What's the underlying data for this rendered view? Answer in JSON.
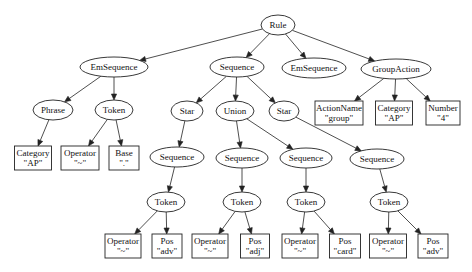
{
  "diagram": {
    "type": "parse-tree",
    "nodes": [
      {
        "id": "rule",
        "label": "Rule",
        "shape": "ellipse",
        "x": 278,
        "y": 25,
        "rx": 17,
        "ry": 10
      },
      {
        "id": "emseq1",
        "label": "EmSequence",
        "shape": "ellipse",
        "x": 114,
        "y": 67,
        "rx": 34,
        "ry": 10
      },
      {
        "id": "seq",
        "label": "Sequence",
        "shape": "ellipse",
        "x": 237,
        "y": 67,
        "rx": 27,
        "ry": 10
      },
      {
        "id": "emseq2",
        "label": "EmSequence",
        "shape": "ellipse",
        "x": 314,
        "y": 68,
        "rx": 32,
        "ry": 10
      },
      {
        "id": "groupaction",
        "label": "GroupAction",
        "shape": "ellipse",
        "x": 396,
        "y": 69,
        "rx": 35,
        "ry": 10
      },
      {
        "id": "phrase",
        "label": "Phrase",
        "shape": "ellipse",
        "x": 53,
        "y": 110,
        "rx": 20,
        "ry": 10
      },
      {
        "id": "token0",
        "label": "Token",
        "shape": "ellipse",
        "x": 114,
        "y": 110,
        "rx": 19,
        "ry": 10
      },
      {
        "id": "star1",
        "label": "Star",
        "shape": "ellipse",
        "x": 187,
        "y": 111,
        "rx": 16,
        "ry": 10
      },
      {
        "id": "union",
        "label": "Union",
        "shape": "ellipse",
        "x": 235,
        "y": 111,
        "rx": 19,
        "ry": 10
      },
      {
        "id": "star2",
        "label": "Star",
        "shape": "ellipse",
        "x": 284,
        "y": 111,
        "rx": 15,
        "ry": 10
      },
      {
        "id": "actionname",
        "label": "ActionName",
        "value": "\"group\"",
        "shape": "box",
        "x": 339,
        "y": 113,
        "w": 48,
        "h": 24
      },
      {
        "id": "category2",
        "label": "Category",
        "value": "\"AP\"",
        "shape": "box",
        "x": 394,
        "y": 113,
        "w": 37,
        "h": 24
      },
      {
        "id": "number",
        "label": "Number",
        "value": "\"4\"",
        "shape": "box",
        "x": 443,
        "y": 113,
        "w": 34,
        "h": 24
      },
      {
        "id": "category1",
        "label": "Category",
        "value": "\"AP\"",
        "shape": "box",
        "x": 33,
        "y": 158,
        "w": 37,
        "h": 24
      },
      {
        "id": "operator0",
        "label": "Operator",
        "value": "\"~\"",
        "shape": "box",
        "x": 80,
        "y": 158,
        "w": 38,
        "h": 24
      },
      {
        "id": "base",
        "label": "Base",
        "value": "\".\"",
        "shape": "box",
        "x": 124,
        "y": 158,
        "w": 30,
        "h": 24
      },
      {
        "id": "seq1",
        "label": "Sequence",
        "shape": "ellipse",
        "x": 177,
        "y": 157,
        "rx": 27,
        "ry": 10
      },
      {
        "id": "seq2",
        "label": "Sequence",
        "shape": "ellipse",
        "x": 242,
        "y": 158,
        "rx": 26,
        "ry": 10
      },
      {
        "id": "seq3",
        "label": "Sequence",
        "shape": "ellipse",
        "x": 306,
        "y": 158,
        "rx": 26,
        "ry": 10
      },
      {
        "id": "seq4",
        "label": "Sequence",
        "shape": "ellipse",
        "x": 377,
        "y": 159,
        "rx": 27,
        "ry": 10
      },
      {
        "id": "token1",
        "label": "Token",
        "shape": "ellipse",
        "x": 166,
        "y": 202,
        "rx": 19,
        "ry": 10
      },
      {
        "id": "token2",
        "label": "Token",
        "shape": "ellipse",
        "x": 242,
        "y": 202,
        "rx": 19,
        "ry": 10
      },
      {
        "id": "token3",
        "label": "Token",
        "shape": "ellipse",
        "x": 306,
        "y": 202,
        "rx": 19,
        "ry": 10
      },
      {
        "id": "token4",
        "label": "Token",
        "shape": "ellipse",
        "x": 389,
        "y": 202,
        "rx": 19,
        "ry": 10
      },
      {
        "id": "op1",
        "label": "Operator",
        "value": "\"~\"",
        "shape": "box",
        "x": 123,
        "y": 246,
        "w": 36,
        "h": 24
      },
      {
        "id": "pos1",
        "label": "Pos",
        "value": "\"adv\"",
        "shape": "box",
        "x": 167,
        "y": 246,
        "w": 30,
        "h": 24
      },
      {
        "id": "op2",
        "label": "Operator",
        "value": "\"~\"",
        "shape": "box",
        "x": 210,
        "y": 246,
        "w": 36,
        "h": 24
      },
      {
        "id": "pos2",
        "label": "Pos",
        "value": "\"adj\"",
        "shape": "box",
        "x": 255,
        "y": 246,
        "w": 29,
        "h": 24
      },
      {
        "id": "op3",
        "label": "Operator",
        "value": "\"~\"",
        "shape": "box",
        "x": 300,
        "y": 246,
        "w": 36,
        "h": 24
      },
      {
        "id": "pos3",
        "label": "Pos",
        "value": "\"card\"",
        "shape": "box",
        "x": 345,
        "y": 246,
        "w": 31,
        "h": 24
      },
      {
        "id": "op4",
        "label": "Operator",
        "value": "\"~\"",
        "shape": "box",
        "x": 388,
        "y": 246,
        "w": 37,
        "h": 24
      },
      {
        "id": "pos4",
        "label": "Pos",
        "value": "\"adv\"",
        "shape": "box",
        "x": 433,
        "y": 246,
        "w": 30,
        "h": 24
      }
    ],
    "edges": [
      [
        "rule",
        "emseq1"
      ],
      [
        "rule",
        "seq"
      ],
      [
        "rule",
        "emseq2"
      ],
      [
        "rule",
        "groupaction"
      ],
      [
        "emseq1",
        "phrase"
      ],
      [
        "emseq1",
        "token0"
      ],
      [
        "seq",
        "star1"
      ],
      [
        "seq",
        "union"
      ],
      [
        "seq",
        "star2"
      ],
      [
        "groupaction",
        "actionname"
      ],
      [
        "groupaction",
        "category2"
      ],
      [
        "groupaction",
        "number"
      ],
      [
        "phrase",
        "category1"
      ],
      [
        "token0",
        "operator0"
      ],
      [
        "token0",
        "base"
      ],
      [
        "star1",
        "seq1"
      ],
      [
        "union",
        "seq2"
      ],
      [
        "union",
        "seq3"
      ],
      [
        "star2",
        "seq4"
      ],
      [
        "seq1",
        "token1"
      ],
      [
        "seq2",
        "token2"
      ],
      [
        "seq3",
        "token3"
      ],
      [
        "seq4",
        "token4"
      ],
      [
        "token1",
        "op1"
      ],
      [
        "token1",
        "pos1"
      ],
      [
        "token2",
        "op2"
      ],
      [
        "token2",
        "pos2"
      ],
      [
        "token3",
        "op3"
      ],
      [
        "token3",
        "pos3"
      ],
      [
        "token4",
        "op4"
      ],
      [
        "token4",
        "pos4"
      ]
    ]
  }
}
